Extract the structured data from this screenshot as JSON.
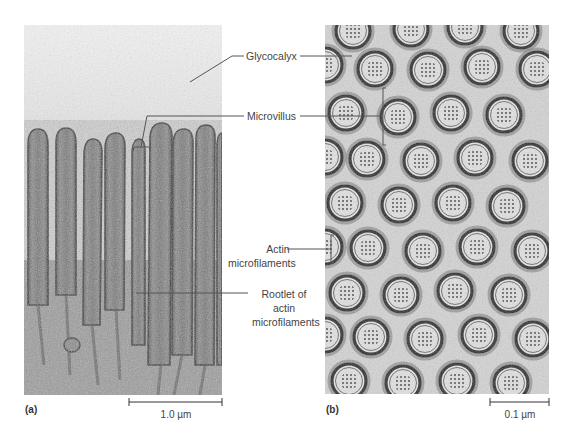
{
  "figure": {
    "panels": [
      {
        "id": "a",
        "tag": "(a)",
        "description": "Longitudinal section of microvilli",
        "scale_bar": "1.0 µm"
      },
      {
        "id": "b",
        "tag": "(b)",
        "description": "Cross section of microvilli",
        "scale_bar": "0.1 µm"
      }
    ],
    "labels": {
      "glycocalyx": "Glycocalyx",
      "microvillus": "Microvillus",
      "actin_line1": "Actin",
      "actin_line2": "microfilaments",
      "rootlet_line1": "Rootlet of",
      "rootlet_line2": "actin",
      "rootlet_line3": "microfilaments"
    },
    "colors": {
      "leader_line": "#555555",
      "label_text": "#444444",
      "background": "#ffffff"
    }
  }
}
